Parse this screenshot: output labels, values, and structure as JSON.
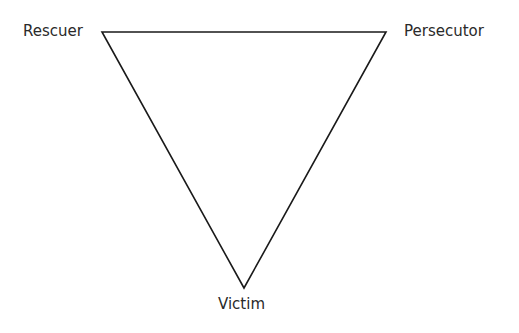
{
  "diagram": {
    "type": "drama-triangle",
    "nodes": [
      {
        "id": "rescuer",
        "label": "Rescuer",
        "position": "top-left"
      },
      {
        "id": "persecutor",
        "label": "Persecutor",
        "position": "top-right"
      },
      {
        "id": "victim",
        "label": "Victim",
        "position": "bottom"
      }
    ],
    "edges": [
      {
        "from": "rescuer",
        "to": "persecutor"
      },
      {
        "from": "persecutor",
        "to": "victim"
      },
      {
        "from": "victim",
        "to": "rescuer"
      }
    ],
    "line_color": "#1a1a1a"
  }
}
